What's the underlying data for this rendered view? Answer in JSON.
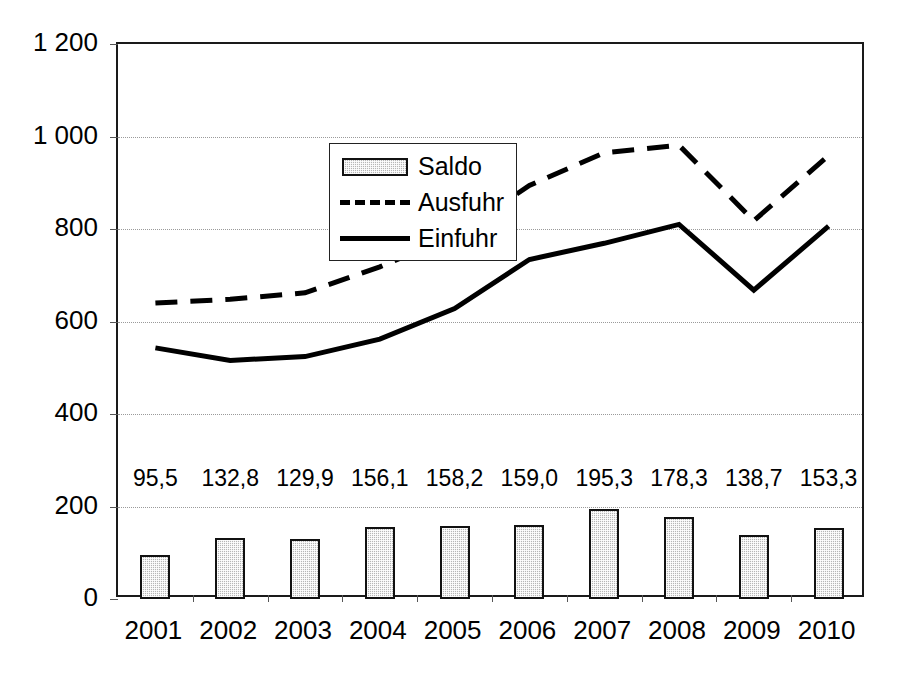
{
  "chart_data": {
    "type": "line",
    "title": "",
    "subtitle": "",
    "xlabel": "",
    "ylabel": "",
    "categories": [
      "2001",
      "2002",
      "2003",
      "2004",
      "2005",
      "2006",
      "2007",
      "2008",
      "2009",
      "2010"
    ],
    "ylim": [
      0,
      1200
    ],
    "ytick_labels": [
      "0",
      "200",
      "400",
      "600",
      "800",
      "1 000",
      "1 200"
    ],
    "ytick_values": [
      0,
      200,
      400,
      600,
      800,
      1000,
      1200
    ],
    "grid": true,
    "legend_position": "upper-left-inside",
    "series": [
      {
        "name": "Saldo",
        "style": "bar",
        "values": [
          95.5,
          132.8,
          129.9,
          156.1,
          158.2,
          159.0,
          195.3,
          178.3,
          138.7,
          153.3
        ],
        "data_labels": [
          "95,5",
          "132,8",
          "129,9",
          "156,1",
          "158,2",
          "159,0",
          "195,3",
          "178,3",
          "138,7",
          "153,3"
        ],
        "color": "#b6b6b6"
      },
      {
        "name": "Ausfuhr",
        "style": "dashed-line",
        "values": [
          640,
          648,
          662,
          718,
          786,
          894,
          965,
          981,
          818,
          959
        ],
        "color": "#000000"
      },
      {
        "name": "Einfuhr",
        "style": "solid-line",
        "values": [
          543,
          516,
          524,
          562,
          628,
          734,
          769,
          810,
          668,
          806
        ],
        "color": "#000000"
      }
    ],
    "legend": [
      {
        "label": "Saldo",
        "key": "bar-swatch"
      },
      {
        "label": "Ausfuhr",
        "key": "dashed-line-swatch"
      },
      {
        "label": "Einfuhr",
        "key": "solid-line-swatch"
      }
    ]
  }
}
